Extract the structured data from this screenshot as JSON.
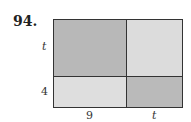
{
  "problem": {
    "number": "94."
  },
  "diagram": {
    "side_labels": {
      "left_top": "t",
      "left_bottom": "4",
      "bottom_left": "9",
      "bottom_right": "t"
    },
    "colors": {
      "top_left": "#b8b8b8",
      "top_right": "#dcdcdc",
      "bottom_left": "#dedede",
      "bottom_right": "#bababa",
      "border": "#333333"
    }
  }
}
